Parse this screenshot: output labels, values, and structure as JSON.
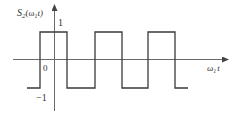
{
  "figure": {
    "y_label_main": "S",
    "y_label_sub": "2",
    "y_label_arg": "(ω",
    "y_label_arg_sub": "1",
    "y_label_arg_end": "t)",
    "x_label_main": "ω",
    "x_label_sub": "1",
    "x_label_end": "t",
    "tick_high": "1",
    "tick_origin": "0",
    "tick_low": "−1"
  },
  "waveform": {
    "type": "square-wave",
    "high_value": 1,
    "low_value": -1,
    "segments": [
      {
        "from_px": 27,
        "to_px": 40,
        "level": -1
      },
      {
        "from_px": 40,
        "to_px": 67,
        "level": 1
      },
      {
        "from_px": 67,
        "to_px": 95,
        "level": -1
      },
      {
        "from_px": 95,
        "to_px": 122,
        "level": 1
      },
      {
        "from_px": 122,
        "to_px": 148,
        "level": -1
      },
      {
        "from_px": 148,
        "to_px": 175,
        "level": 1
      },
      {
        "from_px": 175,
        "to_px": 188,
        "level": -1
      }
    ]
  },
  "colors": {
    "axis": "#6a6a6a",
    "wave": "#3a3a3a",
    "background": "#ffffff"
  }
}
